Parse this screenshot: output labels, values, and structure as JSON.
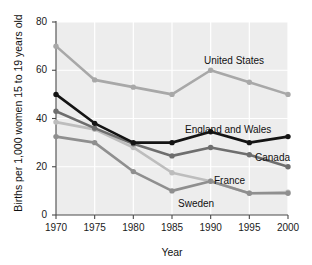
{
  "chart_data": {
    "type": "line",
    "title": "",
    "xlabel": "Year",
    "ylabel": "Births per 1,000 women 15 to 19 years old",
    "x": [
      1970,
      1975,
      1980,
      1985,
      1990,
      1995,
      2000
    ],
    "xtick_labels": [
      "1970",
      "1975",
      "1980",
      "1985",
      "1990",
      "1995",
      "2000"
    ],
    "ytick_labels": [
      "0",
      "20",
      "40",
      "60",
      "80"
    ],
    "yticks": [
      0,
      20,
      40,
      60,
      80
    ],
    "ylim": [
      0,
      80
    ],
    "xlim": [
      1970,
      2000
    ],
    "grid": true,
    "legend_position": "inline-labels",
    "plot_background": "#ededed",
    "series": [
      {
        "name": "United States",
        "color": "#a8a8a8",
        "values": [
          70,
          56,
          53,
          50,
          60,
          55,
          50
        ],
        "label_x": 204,
        "label_y": 55
      },
      {
        "name": "England and Wales",
        "color": "#141414",
        "values": [
          50,
          38,
          30,
          30,
          34.5,
          30,
          32.5
        ],
        "label_x": 185,
        "label_y": 124
      },
      {
        "name": "Canada",
        "color": "#6e6e6e",
        "values": [
          43,
          36,
          29.5,
          24.5,
          28,
          25,
          20
        ],
        "label_x": 255,
        "label_y": 152
      },
      {
        "name": "France",
        "color": "#bdbdbd",
        "values": [
          38.5,
          35.5,
          28,
          17.5,
          14,
          9,
          9.5
        ],
        "label_x": 214,
        "label_y": 175
      },
      {
        "name": "Sweden",
        "color": "#8f8f8f",
        "values": [
          32.5,
          30,
          18,
          10,
          14,
          9,
          9
        ],
        "label_x": 178,
        "label_y": 198
      }
    ]
  }
}
